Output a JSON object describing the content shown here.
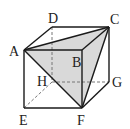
{
  "diagram": {
    "colors": {
      "edge": "#1a1a1a",
      "hidden_edge": "#777777",
      "shade": "#d9d9d9"
    },
    "vertices": {
      "A": {
        "label": "A",
        "x": 24,
        "y": 50
      },
      "B": {
        "label": "B",
        "x": 82,
        "y": 50
      },
      "C": {
        "label": "C",
        "x": 109,
        "y": 27
      },
      "D": {
        "label": "D",
        "x": 52,
        "y": 27
      },
      "E": {
        "label": "E",
        "x": 24,
        "y": 108
      },
      "F": {
        "label": "F",
        "x": 82,
        "y": 108
      },
      "G": {
        "label": "G",
        "x": 109,
        "y": 82
      },
      "H": {
        "label": "H",
        "x": 52,
        "y": 82
      }
    },
    "solid_edges": [
      "AB",
      "BC",
      "CD",
      "DA",
      "AE",
      "EF",
      "BF",
      "FG",
      "GC",
      "AC",
      "CF",
      "AF"
    ],
    "hidden_edges": [
      "DH",
      "HE",
      "HG"
    ],
    "shaded_face": "ACF"
  }
}
